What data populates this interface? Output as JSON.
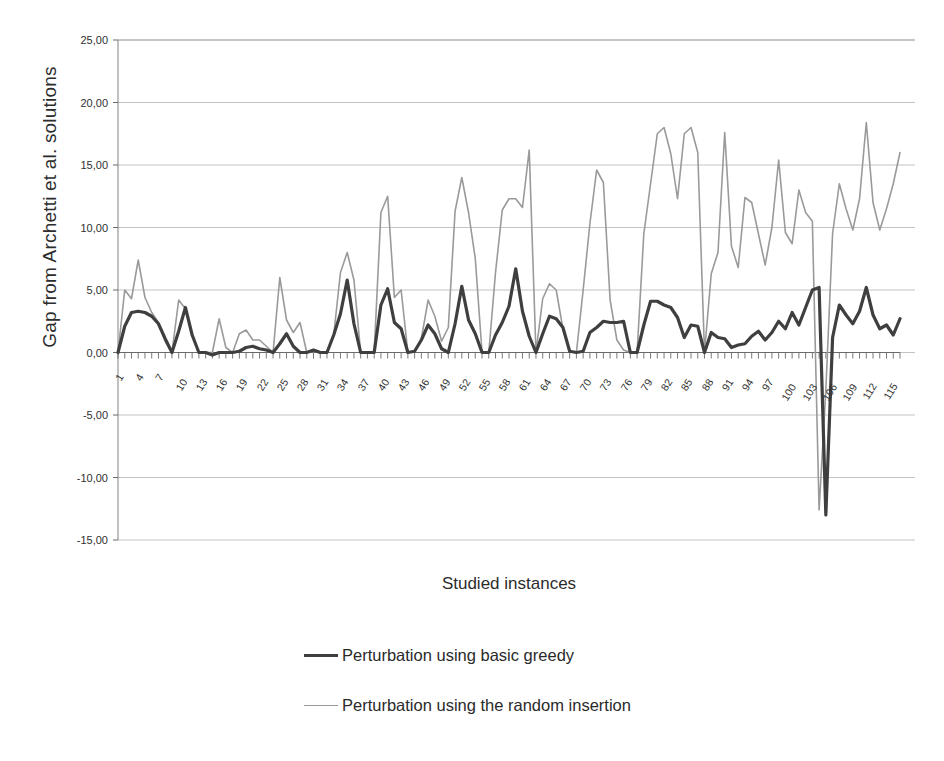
{
  "chart_data": {
    "type": "line",
    "title": "",
    "xlabel": "Studied instances",
    "ylabel": "Gap from Archetti et al.  solutions",
    "ylim": [
      -15,
      25
    ],
    "xlim": [
      1,
      117
    ],
    "grid": true,
    "legend_position": "bottom",
    "ytick_labels": [
      "25,00",
      "20,00",
      "15,00",
      "10,00",
      "5,00",
      "0,00",
      "-5,00",
      "-10,00",
      "-15,00"
    ],
    "ytick_values": [
      25,
      20,
      15,
      10,
      5,
      0,
      -5,
      -10,
      -15
    ],
    "xtick_labels": [
      "1",
      "4",
      "7",
      "10",
      "13",
      "16",
      "19",
      "22",
      "25",
      "28",
      "31",
      "34",
      "37",
      "40",
      "43",
      "46",
      "49",
      "52",
      "55",
      "58",
      "61",
      "64",
      "67",
      "70",
      "73",
      "76",
      "79",
      "82",
      "85",
      "88",
      "91",
      "94",
      "97",
      "100",
      "103",
      "106",
      "109",
      "112",
      "115"
    ],
    "xtick_values": [
      1,
      4,
      7,
      10,
      13,
      16,
      19,
      22,
      25,
      28,
      31,
      34,
      37,
      40,
      43,
      46,
      49,
      52,
      55,
      58,
      61,
      64,
      67,
      70,
      73,
      76,
      79,
      82,
      85,
      88,
      91,
      94,
      97,
      100,
      103,
      106,
      109,
      112,
      115
    ],
    "x": [
      1,
      2,
      3,
      4,
      5,
      6,
      7,
      8,
      9,
      10,
      11,
      12,
      13,
      14,
      15,
      16,
      17,
      18,
      19,
      20,
      21,
      22,
      23,
      24,
      25,
      26,
      27,
      28,
      29,
      30,
      31,
      32,
      33,
      34,
      35,
      36,
      37,
      38,
      39,
      40,
      41,
      42,
      43,
      44,
      45,
      46,
      47,
      48,
      49,
      50,
      51,
      52,
      53,
      54,
      55,
      56,
      57,
      58,
      59,
      60,
      61,
      62,
      63,
      64,
      65,
      66,
      67,
      68,
      69,
      70,
      71,
      72,
      73,
      74,
      75,
      76,
      77,
      78,
      79,
      80,
      81,
      82,
      83,
      84,
      85,
      86,
      87,
      88,
      89,
      90,
      91,
      92,
      93,
      94,
      95,
      96,
      97,
      98,
      99,
      100,
      101,
      102,
      103,
      104,
      105,
      106,
      107,
      108,
      109,
      110,
      111,
      112,
      113,
      114,
      115,
      116,
      117
    ],
    "series": [
      {
        "name": "Perturbation using basic greedy",
        "color": "#3f3f3f",
        "width": 3.2,
        "values": [
          0.0,
          2.1,
          3.2,
          3.3,
          3.2,
          2.9,
          2.3,
          1.1,
          0.0,
          1.7,
          3.6,
          1.4,
          0.0,
          0.0,
          -0.2,
          0.0,
          0.0,
          0.0,
          0.1,
          0.4,
          0.5,
          0.3,
          0.2,
          0.0,
          0.7,
          1.5,
          0.5,
          0.0,
          0.0,
          0.2,
          0.0,
          0.0,
          1.4,
          3.1,
          5.8,
          2.3,
          0.0,
          0.0,
          0.0,
          3.8,
          5.1,
          2.4,
          1.9,
          0.0,
          0.1,
          1.0,
          2.2,
          1.5,
          0.3,
          0.0,
          2.3,
          5.3,
          2.6,
          1.5,
          0.0,
          0.0,
          1.4,
          2.4,
          3.7,
          6.7,
          3.3,
          1.3,
          0.0,
          1.5,
          2.9,
          2.7,
          2.0,
          0.1,
          0.0,
          0.1,
          1.6,
          2.0,
          2.5,
          2.4,
          2.4,
          2.5,
          0.0,
          0.0,
          2.2,
          4.1,
          4.1,
          3.8,
          3.6,
          2.8,
          1.2,
          2.2,
          2.1,
          0.0,
          1.6,
          1.2,
          1.1,
          0.4,
          0.6,
          0.7,
          1.3,
          1.7,
          1.0,
          1.6,
          2.5,
          1.9,
          3.2,
          2.2,
          3.6,
          5.0,
          5.2,
          -13.0,
          1.2,
          3.8,
          3.0,
          2.3,
          3.3,
          5.2,
          3.0,
          1.9,
          2.2,
          1.4,
          2.7
        ]
      },
      {
        "name": "Perturbation using the random insertion",
        "color": "#9a9a9a",
        "width": 1.6,
        "values": [
          0.0,
          5.0,
          4.3,
          7.4,
          4.4,
          3.2,
          2.4,
          0.9,
          0.0,
          4.2,
          3.5,
          1.5,
          0.0,
          0.0,
          0.0,
          2.7,
          0.4,
          0.0,
          1.5,
          1.8,
          1.0,
          1.0,
          0.5,
          0.0,
          6.0,
          2.6,
          1.6,
          2.4,
          0.0,
          0.1,
          0.0,
          0.0,
          1.4,
          6.4,
          8.0,
          5.8,
          0.0,
          0.0,
          0.0,
          11.2,
          12.5,
          4.4,
          5.0,
          0.0,
          0.1,
          1.1,
          4.2,
          2.9,
          0.9,
          2.0,
          11.3,
          14.0,
          11.2,
          7.5,
          0.0,
          0.0,
          6.4,
          11.4,
          12.3,
          12.3,
          11.6,
          16.2,
          0.0,
          4.3,
          5.5,
          5.0,
          1.9,
          0.1,
          0.0,
          5.0,
          10.3,
          14.6,
          13.6,
          4.2,
          1.0,
          0.2,
          0.0,
          0.0,
          9.5,
          13.5,
          17.5,
          18.0,
          15.9,
          12.3,
          17.5,
          18.0,
          16.0,
          0.0,
          6.3,
          8.0,
          17.6,
          8.5,
          6.8,
          12.4,
          12.0,
          9.5,
          7.0,
          10.0,
          15.4,
          9.6,
          8.7,
          13.0,
          11.2,
          10.5,
          -12.6,
          -3.0,
          9.5,
          13.5,
          11.5,
          9.8,
          12.3,
          18.4,
          12.0,
          9.8,
          11.5,
          13.5,
          16.0
        ]
      }
    ]
  },
  "axis": {
    "y_title": "Gap from Archetti et al.  solutions",
    "x_title": "Studied instances"
  },
  "legend": {
    "items": [
      {
        "label": "Perturbation using basic greedy",
        "swatch": "line-swatch-dark"
      },
      {
        "label": "Perturbation using the random insertion",
        "swatch": "line-swatch-gray"
      }
    ]
  }
}
